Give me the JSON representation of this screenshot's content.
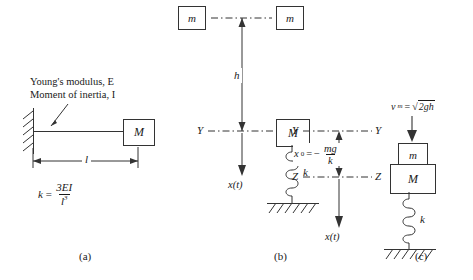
{
  "figure": {
    "type": "engineering-diagram",
    "panels": [
      {
        "id": "a",
        "label": "(a)",
        "description": "Cantilever beam with end mass",
        "annotations": {
          "youngs_modulus": "Young's modulus, E",
          "moment_of_inertia": "Moment of inertia, I"
        },
        "mass_label": "M",
        "length_label": "l",
        "stiffness": {
          "lhs": "k",
          "equals": "=",
          "numerator": "3EI",
          "denominator": "l",
          "denominator_exponent": "3"
        }
      },
      {
        "id": "b",
        "label": "(b)",
        "description": "Mass m dropped from height h onto mass M on spring",
        "mass_top_left": "m",
        "mass_top_right": "m",
        "height_label": "h",
        "datum_left": "Y",
        "datum_right": "Y",
        "mass_label": "M",
        "spring_label": "k",
        "displacement_label": "x(t)"
      },
      {
        "id": "c",
        "label": "(c)",
        "description": "Combined masses after impact with static deflection",
        "velocity": {
          "symbol": "v",
          "subscript": "m",
          "equals": "=",
          "radical": "√",
          "radicand": "2gh"
        },
        "mass_small": "m",
        "mass_large": "M",
        "spring_label": "k",
        "datum_y_left": "Y",
        "datum_y_right": "Y",
        "datum_z_left": "Z",
        "datum_z_right": "Z",
        "static_deflection": {
          "lhs": "x",
          "subscript": "0",
          "equals": "=",
          "sign": "−",
          "numerator": "mg",
          "denominator": "k"
        },
        "displacement_label": "x(t)"
      }
    ]
  },
  "colors": {
    "stroke": "#333333",
    "text": "#1a1a1a",
    "background": "#ffffff"
  }
}
